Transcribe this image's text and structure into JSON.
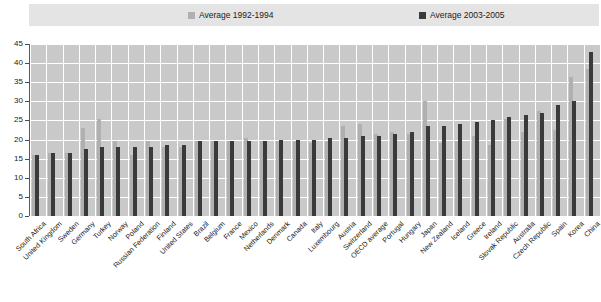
{
  "legend": {
    "entries": [
      {
        "label": "Average 1992-1994",
        "color": "#b0b0b0"
      },
      {
        "label": "Average 2003-2005",
        "color": "#3a3a3a"
      }
    ]
  },
  "axis": {
    "y_ticks": [
      "0",
      "5",
      "10",
      "15",
      "20",
      "25",
      "30",
      "35",
      "40",
      "45"
    ]
  },
  "chart_data": {
    "type": "bar",
    "title": "",
    "subtitle": "",
    "xlabel": "",
    "ylabel": "",
    "ylim": [
      0,
      45
    ],
    "ytick_step": 5,
    "grid": true,
    "legend_position": "top",
    "categories": [
      "South Africa",
      "United Kingdom",
      "Sweden",
      "Germany",
      "Turkey",
      "Norway",
      "Poland",
      "Russian Federation",
      "Finland",
      "United States",
      "Brazil",
      "Belgium",
      "France",
      "Mexico",
      "Netherlands",
      "Denmark",
      "Canada",
      "Italy",
      "Luxembourg",
      "Austria",
      "Switzerland",
      "OECD average",
      "Portugal",
      "Hungary",
      "Japan",
      "New Zealand",
      "Iceland",
      "Greece",
      "Ireland",
      "Slovak Republic",
      "Australia",
      "Czech Republic",
      "Spain",
      "Korea",
      "China"
    ],
    "series": [
      {
        "name": "Average 1992-1994",
        "color": "#b0b0b0",
        "values": [
          16.0,
          16.5,
          16.5,
          23.0,
          25.5,
          19.5,
          16.0,
          19.5,
          18.0,
          18.0,
          19.5,
          19.5,
          19.5,
          20.5,
          19.5,
          19.5,
          19.5,
          19.0,
          19.5,
          23.5,
          24.0,
          21.5,
          22.0,
          21.5,
          30.0,
          19.0,
          19.5,
          21.0,
          18.5,
          25.5,
          22.0,
          27.5,
          22.5,
          36.5,
          38.5
        ]
      },
      {
        "name": "Average 2003-2005",
        "color": "#3a3a3a",
        "values": [
          16.0,
          16.5,
          16.5,
          17.5,
          18.0,
          18.0,
          18.0,
          18.0,
          18.5,
          18.5,
          19.5,
          19.5,
          19.5,
          19.5,
          19.5,
          20.0,
          20.0,
          20.0,
          20.5,
          20.5,
          21.0,
          21.0,
          21.5,
          22.0,
          23.5,
          23.5,
          24.0,
          24.5,
          25.0,
          26.0,
          26.5,
          27.0,
          29.0,
          30.0,
          43.0
        ]
      }
    ]
  }
}
